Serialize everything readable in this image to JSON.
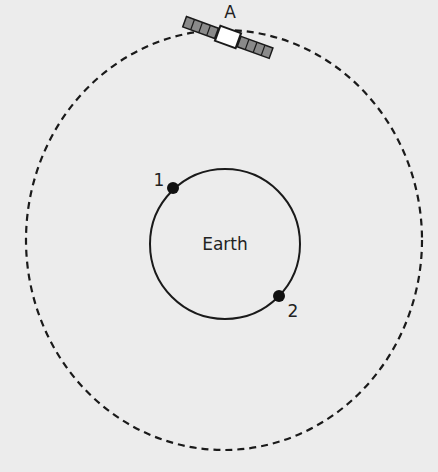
{
  "diagram": {
    "satellite_label": "A",
    "earth_label": "Earth",
    "points": [
      {
        "label": "1"
      },
      {
        "label": "2"
      }
    ],
    "colors": {
      "background": "#ececec",
      "line": "#1a1a1a",
      "panel": "#8a8a8a",
      "satellite_body": "#ffffff"
    }
  }
}
